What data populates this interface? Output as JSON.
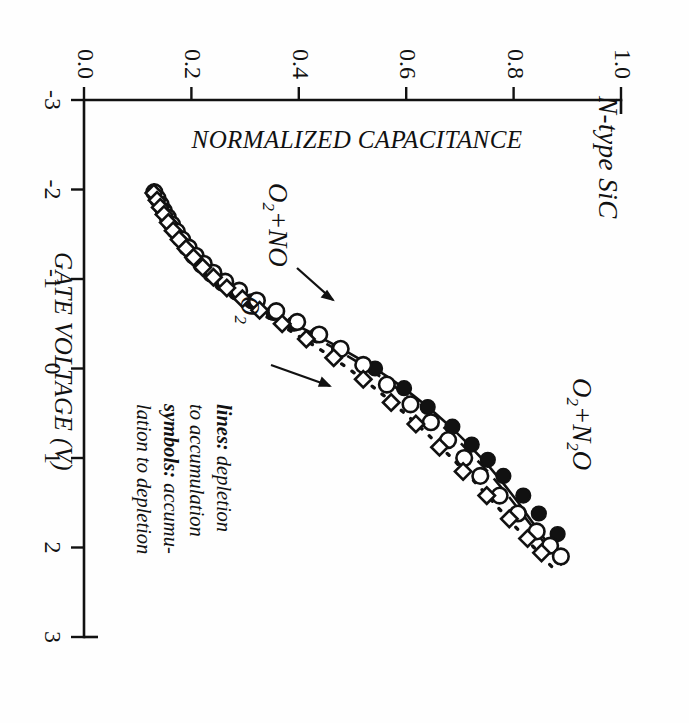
{
  "figure": {
    "sample_label": "N-type SiC",
    "legend_note_line1_key": "lines:",
    "legend_note_line1_val": " depletion",
    "legend_note_line2": "to accumulation",
    "legend_note_line3_key": "symbols:",
    "legend_note_line3_val": " accumu-",
    "legend_note_line4": "lation to depletion"
  },
  "chart_data": {
    "type": "line",
    "title": "",
    "subtitle": "N-type SiC",
    "xlabel": "GATE VOLTAGE (V)",
    "ylabel": "NORMALIZED CAPACITANCE",
    "xlim": [
      -3,
      3
    ],
    "ylim": [
      0.0,
      1.0
    ],
    "xticks": [
      -3,
      -2,
      -1,
      0,
      1,
      2,
      3
    ],
    "xtick_labels": [
      "-3",
      "-2",
      "-1",
      "0",
      "1",
      "2",
      "3"
    ],
    "yticks": [
      0.0,
      0.2,
      0.4,
      0.6,
      0.8,
      1.0
    ],
    "ytick_labels": [
      "0.0",
      "0.2",
      "0.4",
      "0.6",
      "0.8",
      "1.0"
    ],
    "grid": false,
    "legend_position": "inside-lower-right",
    "annotations": [
      "lines: depletion to accumulation",
      "symbols: accumulation to depletion",
      "N-type SiC"
    ],
    "series": [
      {
        "name": "O2+NO",
        "label": "O₂+NO",
        "linestyle": "solid",
        "marker": "filled-circle",
        "line_x": [
          -2.0,
          -1.9,
          -1.8,
          -1.7,
          -1.6,
          -1.5,
          -1.4,
          -1.3,
          -1.2,
          -1.1,
          -1.0,
          -0.9,
          -0.8,
          -0.7,
          -0.6,
          -0.5,
          -0.4,
          -0.3,
          -0.2,
          -0.1,
          0.0,
          0.1,
          0.2,
          0.3,
          0.4,
          0.5,
          0.6,
          0.7,
          0.8,
          0.9,
          1.0,
          1.1,
          1.2,
          1.3,
          1.4,
          1.5,
          1.6,
          1.7,
          1.8,
          1.9,
          2.0,
          2.1,
          2.15
        ],
        "line_y": [
          0.13,
          0.137,
          0.144,
          0.152,
          0.16,
          0.17,
          0.181,
          0.193,
          0.207,
          0.224,
          0.244,
          0.268,
          0.295,
          0.325,
          0.357,
          0.39,
          0.423,
          0.455,
          0.486,
          0.515,
          0.542,
          0.567,
          0.591,
          0.613,
          0.634,
          0.654,
          0.673,
          0.691,
          0.708,
          0.724,
          0.74,
          0.755,
          0.769,
          0.783,
          0.796,
          0.809,
          0.821,
          0.833,
          0.845,
          0.857,
          0.868,
          0.879,
          0.884
        ],
        "marker_x": [
          -1.95,
          -1.88,
          -1.8,
          -1.72,
          -1.63,
          -1.54,
          -1.45,
          -1.35,
          -1.25,
          -1.15,
          -1.05,
          -0.95,
          -0.85,
          -0.75,
          -0.62,
          -0.5,
          -0.37,
          -0.22,
          0.0,
          0.22,
          0.43,
          0.65,
          0.85,
          1.02,
          1.2,
          1.42,
          1.62,
          1.85
        ],
        "marker_y": [
          0.133,
          0.139,
          0.145,
          0.152,
          0.159,
          0.168,
          0.178,
          0.19,
          0.203,
          0.218,
          0.236,
          0.257,
          0.283,
          0.312,
          0.353,
          0.391,
          0.433,
          0.475,
          0.542,
          0.596,
          0.64,
          0.686,
          0.722,
          0.752,
          0.781,
          0.818,
          0.847,
          0.882
        ]
      },
      {
        "name": "O2",
        "label": "O₂",
        "linestyle": "dashed",
        "marker": "open-circle",
        "line_x": [
          -2.0,
          -1.9,
          -1.8,
          -1.7,
          -1.6,
          -1.5,
          -1.4,
          -1.3,
          -1.2,
          -1.1,
          -1.0,
          -0.9,
          -0.8,
          -0.7,
          -0.6,
          -0.5,
          -0.4,
          -0.3,
          -0.2,
          -0.1,
          0.0,
          0.1,
          0.2,
          0.3,
          0.4,
          0.5,
          0.6,
          0.7,
          0.8,
          0.9,
          1.0,
          1.1,
          1.2,
          1.3,
          1.4,
          1.5,
          1.6,
          1.7,
          1.8,
          1.9,
          2.0,
          2.1,
          2.2
        ],
        "line_y": [
          0.128,
          0.135,
          0.142,
          0.15,
          0.158,
          0.168,
          0.179,
          0.191,
          0.205,
          0.221,
          0.24,
          0.263,
          0.289,
          0.318,
          0.349,
          0.381,
          0.413,
          0.444,
          0.474,
          0.502,
          0.529,
          0.554,
          0.578,
          0.6,
          0.621,
          0.641,
          0.66,
          0.678,
          0.696,
          0.712,
          0.728,
          0.744,
          0.759,
          0.773,
          0.787,
          0.8,
          0.813,
          0.826,
          0.839,
          0.851,
          0.863,
          0.876,
          0.89
        ],
        "marker_x": [
          -1.97,
          -1.9,
          -1.83,
          -1.76,
          -1.69,
          -1.61,
          -1.53,
          -1.44,
          -1.35,
          -1.26,
          -1.17,
          -1.07,
          -0.97,
          -0.87,
          -0.76,
          -0.64,
          -0.52,
          -0.38,
          -0.22,
          -0.04,
          0.18,
          0.4,
          0.6,
          0.8,
          1.0,
          1.2,
          1.42,
          1.62,
          1.82,
          1.98,
          2.1
        ],
        "marker_y": [
          0.131,
          0.137,
          0.143,
          0.149,
          0.156,
          0.164,
          0.173,
          0.183,
          0.195,
          0.208,
          0.223,
          0.241,
          0.263,
          0.289,
          0.322,
          0.358,
          0.397,
          0.438,
          0.478,
          0.52,
          0.564,
          0.608,
          0.646,
          0.678,
          0.708,
          0.738,
          0.774,
          0.808,
          0.843,
          0.868,
          0.888
        ]
      },
      {
        "name": "O2+N2O",
        "label": "O₂+N₂O",
        "linestyle": "dotted",
        "marker": "open-diamond",
        "line_x": [
          -2.0,
          -1.9,
          -1.8,
          -1.7,
          -1.6,
          -1.5,
          -1.4,
          -1.3,
          -1.2,
          -1.1,
          -1.0,
          -0.9,
          -0.8,
          -0.7,
          -0.6,
          -0.5,
          -0.4,
          -0.3,
          -0.2,
          -0.1,
          0.0,
          0.1,
          0.2,
          0.3,
          0.4,
          0.5,
          0.6,
          0.7,
          0.8,
          0.9,
          1.0,
          1.1,
          1.2,
          1.3,
          1.4,
          1.5,
          1.6,
          1.7,
          1.8,
          1.9,
          2.0,
          2.1,
          2.22
        ],
        "line_y": [
          0.126,
          0.133,
          0.14,
          0.148,
          0.156,
          0.166,
          0.177,
          0.189,
          0.202,
          0.218,
          0.236,
          0.257,
          0.281,
          0.307,
          0.334,
          0.362,
          0.39,
          0.417,
          0.443,
          0.468,
          0.492,
          0.515,
          0.537,
          0.558,
          0.578,
          0.597,
          0.616,
          0.634,
          0.651,
          0.668,
          0.685,
          0.701,
          0.717,
          0.733,
          0.748,
          0.763,
          0.778,
          0.793,
          0.808,
          0.823,
          0.838,
          0.853,
          0.872
        ],
        "marker_x": [
          -1.96,
          -1.88,
          -1.8,
          -1.72,
          -1.63,
          -1.54,
          -1.44,
          -1.34,
          -1.24,
          -1.13,
          -1.02,
          -0.9,
          -0.78,
          -0.65,
          -0.5,
          -0.33,
          -0.12,
          0.12,
          0.38,
          0.62,
          0.88,
          1.15,
          1.42,
          1.68,
          1.9,
          2.06
        ],
        "marker_y": [
          0.13,
          0.136,
          0.142,
          0.149,
          0.157,
          0.166,
          0.177,
          0.19,
          0.204,
          0.221,
          0.241,
          0.266,
          0.295,
          0.327,
          0.369,
          0.414,
          0.465,
          0.52,
          0.572,
          0.618,
          0.662,
          0.706,
          0.75,
          0.792,
          0.826,
          0.852
        ]
      }
    ],
    "series_tags": [
      {
        "label": "O₂+NO",
        "name": "o2-no-tag"
      },
      {
        "label": "O₂",
        "name": "o2-tag"
      },
      {
        "label": "O₂+N₂O",
        "name": "o2-n2o-tag"
      }
    ]
  }
}
